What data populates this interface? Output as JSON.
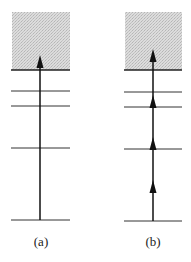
{
  "figure": {
    "panels": [
      {
        "label": "(a)",
        "levels": 5,
        "arrow_style": "single-arrow-to-continuum",
        "continuum": "shaded-band"
      },
      {
        "label": "(b)",
        "levels": 5,
        "arrow_style": "stepwise-arrows-through-levels",
        "continuum": "shaded-band"
      }
    ]
  }
}
